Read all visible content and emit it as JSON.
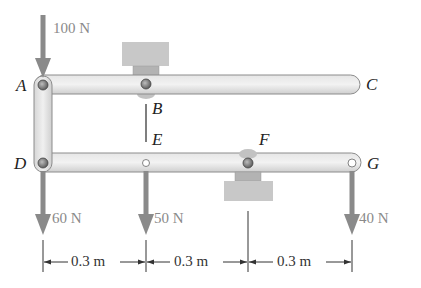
{
  "diagram": {
    "type": "mechanism_frame",
    "points": {
      "A": "A",
      "B": "B",
      "C": "C",
      "D": "D",
      "E": "E",
      "F": "F",
      "G": "G"
    },
    "forces": [
      {
        "id": "force-A",
        "label": "100 N",
        "point": "A",
        "direction": "down"
      },
      {
        "id": "force-D",
        "label": "60 N",
        "point": "D",
        "direction": "down"
      },
      {
        "id": "force-E",
        "label": "50 N",
        "point": "E",
        "direction": "down"
      },
      {
        "id": "force-G",
        "label": "40 N",
        "point": "G",
        "direction": "down"
      }
    ],
    "dimensions": [
      {
        "label": "0.3 m",
        "from": "D",
        "to": "E"
      },
      {
        "label": "0.3 m",
        "from": "E",
        "to": "F"
      },
      {
        "label": "0.3 m",
        "from": "F",
        "to": "G"
      }
    ],
    "members": [
      "ABC",
      "DEFG",
      "AD",
      "BE"
    ],
    "supports": [
      "B (pin, support above)",
      "F (pin, support below)"
    ],
    "colors": {
      "bar_fill": "#d9d9d9",
      "bar_stroke": "#8c8c8c",
      "arrow": "#8a8a8a",
      "support": "#c4c4c4",
      "text": "#222222"
    }
  }
}
